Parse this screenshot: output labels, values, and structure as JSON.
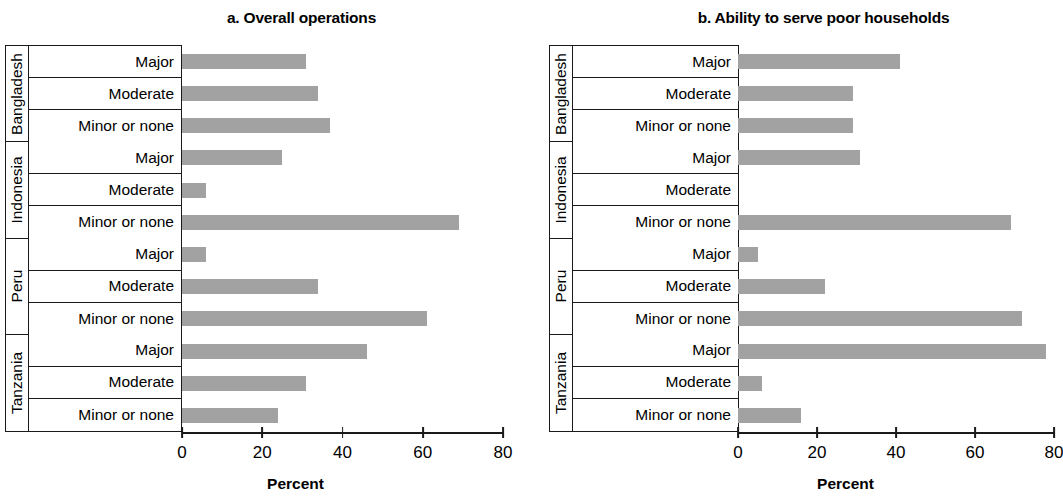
{
  "figure": {
    "panels": [
      {
        "id": "a",
        "title": "a. Overall operations",
        "xlabel": "Percent"
      },
      {
        "id": "b",
        "title": "b. Ability to serve poor households",
        "xlabel": "Percent"
      }
    ],
    "countries": [
      "Bangladesh",
      "Indonesia",
      "Peru",
      "Tanzania"
    ],
    "categories": [
      "Major",
      "Moderate",
      "Minor or none"
    ],
    "ticks": [
      "0",
      "20",
      "40",
      "60",
      "80"
    ],
    "bar_color": "#a2a2a2",
    "axis_color": "#1a1a1a"
  },
  "chart_data": [
    {
      "type": "bar",
      "title": "a. Overall operations",
      "xlabel": "Percent",
      "ylabel": "",
      "xlim": [
        0,
        80
      ],
      "grid": false,
      "legend": "none",
      "orientation": "horizontal",
      "categories": [
        "Bangladesh - Major",
        "Bangladesh - Moderate",
        "Bangladesh - Minor or none",
        "Indonesia - Major",
        "Indonesia - Moderate",
        "Indonesia - Minor or none",
        "Peru - Major",
        "Peru - Moderate",
        "Peru - Minor or none",
        "Tanzania - Major",
        "Tanzania - Moderate",
        "Tanzania - Minor or none"
      ],
      "values": [
        31,
        34,
        37,
        25,
        6,
        69,
        6,
        34,
        61,
        46,
        31,
        24
      ],
      "tick_labels": [
        "0",
        "20",
        "40",
        "60",
        "80"
      ]
    },
    {
      "type": "bar",
      "title": "b. Ability to serve poor households",
      "xlabel": "Percent",
      "ylabel": "",
      "xlim": [
        0,
        80
      ],
      "grid": false,
      "legend": "none",
      "orientation": "horizontal",
      "categories": [
        "Bangladesh - Major",
        "Bangladesh - Moderate",
        "Bangladesh - Minor or none",
        "Indonesia - Major",
        "Indonesia - Moderate",
        "Indonesia - Minor or none",
        "Peru - Major",
        "Peru - Moderate",
        "Peru - Minor or none",
        "Tanzania - Major",
        "Tanzania - Moderate",
        "Tanzania - Minor or none"
      ],
      "values": [
        41,
        29,
        29,
        31,
        0,
        69,
        5,
        22,
        72,
        78,
        6,
        16
      ],
      "tick_labels": [
        "0",
        "20",
        "40",
        "60",
        "80"
      ]
    }
  ]
}
